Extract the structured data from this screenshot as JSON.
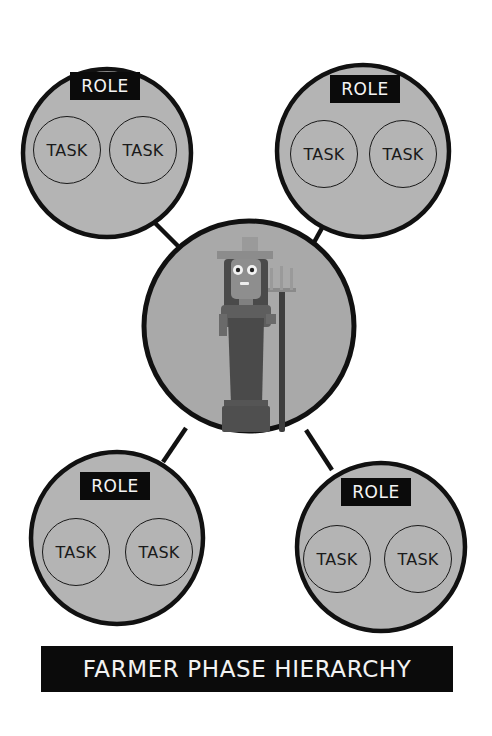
{
  "title": "FARMER PHASE HIERARCHY",
  "center_node": {
    "icon": "farmer-with-pitchfork-icon",
    "description": "Farmer character holding a pitchfork"
  },
  "role_nodes": [
    {
      "position": "top-left",
      "role_label": "ROLE",
      "tasks": [
        "TASK",
        "TASK"
      ]
    },
    {
      "position": "top-right",
      "role_label": "ROLE",
      "tasks": [
        "TASK",
        "TASK"
      ]
    },
    {
      "position": "bottom-left",
      "role_label": "ROLE",
      "tasks": [
        "TASK",
        "TASK"
      ]
    },
    {
      "position": "bottom-right",
      "role_label": "ROLE",
      "tasks": [
        "TASK",
        "TASK"
      ]
    }
  ],
  "colors": {
    "node_fill": "#b4b4b4",
    "node_stroke": "#111111",
    "label_bg": "#0b0b0b",
    "label_text": "#f4f4f4",
    "background": "#ffffff"
  }
}
